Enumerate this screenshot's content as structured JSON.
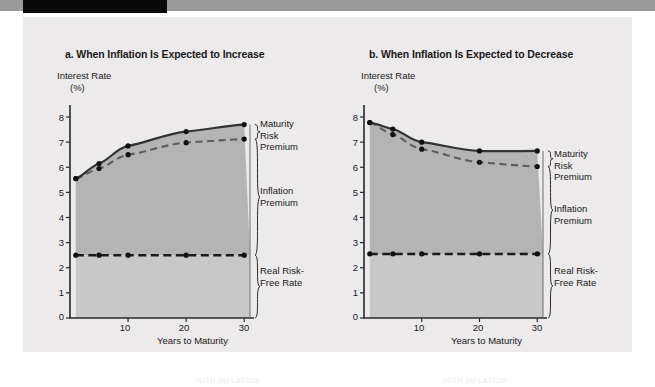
{
  "figure": {
    "panel_bg": "#eceaea",
    "topbar_color": "#9a9a9a",
    "topbar_black_color": "#0a0a0a"
  },
  "charts": [
    {
      "id": "chart-a",
      "title": "a. When Inflation Is Expected to Increase",
      "ylabel_line1": "Interest Rate",
      "ylabel_line2": "(%)",
      "xlabel": "Years to Maturity",
      "yticks": [
        "8",
        "7",
        "6",
        "5",
        "4",
        "3",
        "2",
        "1",
        "0"
      ],
      "xticks": [
        "10",
        "20",
        "30"
      ],
      "annotations": {
        "maturity_risk_premium": "Maturity\nRisk\nPremium",
        "maturity_risk_premium_l1": "Maturity",
        "maturity_risk_premium_l2": "Risk",
        "maturity_risk_premium_l3": "Premium",
        "inflation_premium_l1": "Inflation",
        "inflation_premium_l2": "Premium",
        "real_risk_free_l1": "Real Risk-",
        "real_risk_free_l2": "Free Rate"
      }
    },
    {
      "id": "chart-b",
      "title": "b. When Inflation Is Expected to Decrease",
      "ylabel_line1": "Interest Rate",
      "ylabel_line2": "(%)",
      "xlabel": "Years to Maturity",
      "yticks": [
        "8",
        "7",
        "6",
        "5",
        "4",
        "3",
        "2",
        "1",
        "0"
      ],
      "xticks": [
        "10",
        "20",
        "30"
      ],
      "annotations": {
        "maturity_risk_premium_l1": "Maturity",
        "maturity_risk_premium_l2": "Risk",
        "maturity_risk_premium_l3": "Premium",
        "inflation_premium_l1": "Inflation",
        "inflation_premium_l2": "Premium",
        "real_risk_free_l1": "Real Risk-",
        "real_risk_free_l2": "Free Rate"
      }
    }
  ],
  "chart_data": [
    {
      "type": "line",
      "id": "chart-a",
      "title": "a. When Inflation Is Expected to Increase",
      "xlabel": "Years to Maturity",
      "ylabel": "Interest Rate (%)",
      "xlim": [
        0,
        31
      ],
      "ylim": [
        0,
        8.6
      ],
      "xticks": [
        10,
        20,
        30
      ],
      "yticks": [
        0,
        1,
        2,
        3,
        4,
        5,
        6,
        7,
        8
      ],
      "grid": false,
      "legend": "none",
      "markers_x": [
        1,
        5,
        10,
        20,
        30
      ],
      "series": [
        {
          "name": "Nominal interest rate (with maturity risk premium)",
          "style": "solid",
          "color": "#333333",
          "x": [
            1,
            5,
            10,
            20,
            30
          ],
          "values": [
            5.55,
            6.15,
            6.85,
            7.42,
            7.7
          ]
        },
        {
          "name": "Expected rate (inflation premium + real risk-free rate)",
          "style": "dashed",
          "color": "#5e5e5e",
          "x": [
            1,
            5,
            10,
            20,
            30
          ],
          "values": [
            5.55,
            5.95,
            6.5,
            6.98,
            7.12
          ]
        },
        {
          "name": "Real Risk-Free Rate",
          "style": "dashed",
          "color": "#1a1a1a",
          "x": [
            1,
            5,
            10,
            20,
            30
          ],
          "values": [
            2.5,
            2.5,
            2.5,
            2.5,
            2.5
          ]
        }
      ],
      "bands": [
        {
          "name": "Inflation Premium",
          "color": "#b4b4b4"
        },
        {
          "name": "Real Risk-Free Rate",
          "color": "#c8c8c8"
        }
      ]
    },
    {
      "type": "line",
      "id": "chart-b",
      "title": "b. When Inflation Is Expected to Decrease",
      "xlabel": "Years to Maturity",
      "ylabel": "Interest Rate (%)",
      "xlim": [
        0,
        31
      ],
      "ylim": [
        0,
        8.6
      ],
      "xticks": [
        10,
        20,
        30
      ],
      "yticks": [
        0,
        1,
        2,
        3,
        4,
        5,
        6,
        7,
        8
      ],
      "grid": false,
      "legend": "none",
      "markers_x": [
        1,
        5,
        10,
        20,
        30
      ],
      "series": [
        {
          "name": "Nominal interest rate (with maturity risk premium)",
          "style": "solid",
          "color": "#333333",
          "x": [
            1,
            5,
            10,
            20,
            30
          ],
          "values": [
            7.78,
            7.52,
            7.0,
            6.65,
            6.65
          ]
        },
        {
          "name": "Expected rate (inflation premium + real risk-free rate)",
          "style": "dashed",
          "color": "#5e5e5e",
          "x": [
            1,
            5,
            10,
            20,
            30
          ],
          "values": [
            7.78,
            7.3,
            6.72,
            6.2,
            6.03
          ]
        },
        {
          "name": "Real Risk-Free Rate",
          "style": "dashed",
          "color": "#1a1a1a",
          "x": [
            1,
            5,
            10,
            20,
            30
          ],
          "values": [
            2.55,
            2.55,
            2.55,
            2.55,
            2.55
          ]
        }
      ],
      "bands": [
        {
          "name": "Inflation Premium",
          "color": "#b4b4b4"
        },
        {
          "name": "Real Risk-Free Rate",
          "color": "#c8c8c8"
        }
      ]
    }
  ]
}
